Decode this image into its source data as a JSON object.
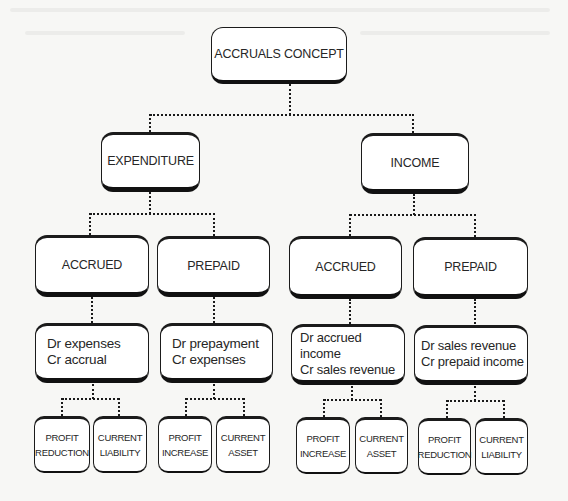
{
  "diagram": {
    "root": {
      "label": "ACCRUALS CONCEPT"
    },
    "branches": [
      {
        "label": "EXPENDITURE",
        "children": [
          {
            "label": "ACCRUED",
            "journal": {
              "line1": "Dr expenses",
              "line2": "Cr accrual"
            },
            "effects": [
              {
                "line1": "PROFIT",
                "line2": "REDUCTION"
              },
              {
                "line1": "CURRENT",
                "line2": "LIABILITY"
              }
            ]
          },
          {
            "label": "PREPAID",
            "journal": {
              "line1": "Dr prepayment",
              "line2": "Cr expenses"
            },
            "effects": [
              {
                "line1": "PROFIT",
                "line2": "INCREASE"
              },
              {
                "line1": "CURRENT",
                "line2": "ASSET"
              }
            ]
          }
        ]
      },
      {
        "label": "INCOME",
        "children": [
          {
            "label": "ACCRUED",
            "journal": {
              "line1": "Dr accrued income",
              "line2": "Cr sales revenue"
            },
            "effects": [
              {
                "line1": "PROFIT",
                "line2": "INCREASE"
              },
              {
                "line1": "CURRENT",
                "line2": "ASSET"
              }
            ]
          },
          {
            "label": "PREPAID",
            "journal": {
              "line1": "Dr sales revenue",
              "line2": "Cr prepaid income"
            },
            "effects": [
              {
                "line1": "PROFIT",
                "line2": "REDUCTION"
              },
              {
                "line1": "CURRENT",
                "line2": "LIABILITY"
              }
            ]
          }
        ]
      }
    ],
    "colors": {
      "border": "#1b1b1b",
      "box_fill": "#ffffff",
      "background": "#f7f7f5",
      "text": "#262626"
    }
  }
}
